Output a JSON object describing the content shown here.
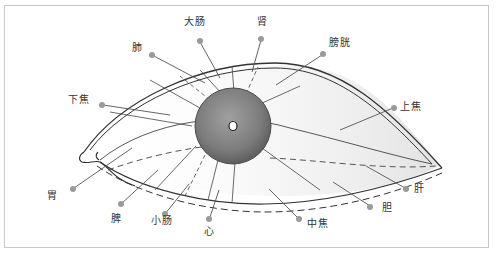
{
  "diagram": {
    "type": "eye-iris-organ-map",
    "colors": {
      "frame_border": "#c8c8c8",
      "outline": "#333333",
      "leader_line": "#555555",
      "dot": "#999999",
      "pupil_dark": "#6e6e6e",
      "pupil_light": "#a0a0a0",
      "label_text": "#333333"
    },
    "labels": [
      {
        "id": "large-intestine",
        "text": "大肠",
        "x": 184,
        "y": 16
      },
      {
        "id": "kidney",
        "text": "肾",
        "x": 258,
        "y": 16
      },
      {
        "id": "lung",
        "text": "肺",
        "x": 132,
        "y": 42
      },
      {
        "id": "bladder",
        "text": "膀胱",
        "x": 330,
        "y": 38
      },
      {
        "id": "lower-jiao",
        "text": "下焦",
        "x": 68,
        "y": 94
      },
      {
        "id": "upper-jiao",
        "text": "上焦",
        "x": 400,
        "y": 101
      },
      {
        "id": "stomach",
        "text": "胃",
        "x": 48,
        "y": 190
      },
      {
        "id": "liver",
        "text": "肝",
        "x": 415,
        "y": 183
      },
      {
        "id": "gallbladder",
        "text": "胆",
        "x": 383,
        "y": 202
      },
      {
        "id": "spleen",
        "text": "脾",
        "x": 111,
        "y": 213
      },
      {
        "id": "small-intestine",
        "text": "小肠",
        "x": 151,
        "y": 215
      },
      {
        "id": "heart",
        "text": "心",
        "x": 205,
        "y": 225
      },
      {
        "id": "middle-jiao",
        "text": "中焦",
        "x": 307,
        "y": 218
      }
    ]
  }
}
